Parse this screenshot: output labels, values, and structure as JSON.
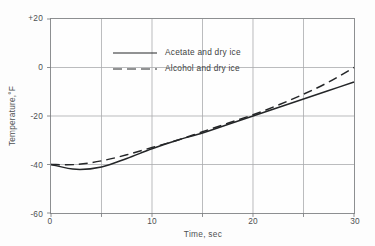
{
  "chart_data": {
    "type": "line",
    "title": "",
    "xlabel": "Time, sec",
    "ylabel": "Temperature,°F",
    "xlim": [
      0,
      30
    ],
    "ylim": [
      -60,
      20
    ],
    "xticks": [
      "0",
      "10",
      "20",
      "30"
    ],
    "xtick_values": [
      0,
      10,
      20,
      30
    ],
    "xminor_values": [
      5,
      15,
      25
    ],
    "yticks": [
      "+20",
      "0",
      "-20",
      "-40",
      "-60"
    ],
    "ytick_values": [
      20,
      0,
      -20,
      -40,
      -60
    ],
    "grid": true,
    "grid_x_values": [
      5,
      10,
      15,
      20,
      25
    ],
    "grid_y_values": [
      0,
      -20,
      -40
    ],
    "legend_position": "upper left",
    "x": [
      0,
      2.5,
      5,
      7.5,
      10,
      12.5,
      15,
      17.5,
      20,
      22.5,
      25,
      27.5,
      30
    ],
    "series": [
      {
        "name": "Acetate and dry ice",
        "style": "solid",
        "values": [
          -40.0,
          -42.0,
          -41.0,
          -37.5,
          -33.5,
          -30.0,
          -27.0,
          -23.5,
          -20.0,
          -16.5,
          -13.0,
          -9.5,
          -6.0
        ]
      },
      {
        "name": "Alcohol and dry ice",
        "style": "dashed",
        "values": [
          -40.0,
          -40.0,
          -38.5,
          -36.0,
          -33.0,
          -30.0,
          -26.5,
          -23.0,
          -19.5,
          -15.5,
          -11.0,
          -6.0,
          0.0
        ]
      }
    ]
  },
  "legend": {
    "entries": [
      {
        "label": "Acetate and dry ice",
        "style": "solid"
      },
      {
        "label": "Alcohol and dry ice",
        "style": "dashed"
      }
    ]
  },
  "colors": {
    "curve": "#242628",
    "grid": "#a9abad",
    "frame": "#8d8f91",
    "text": "#4e5052",
    "background": "#fdfdfd"
  }
}
